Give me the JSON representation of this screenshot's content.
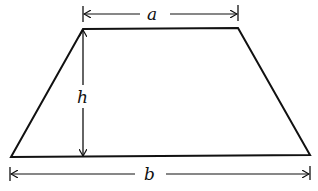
{
  "diagram": {
    "type": "trapezoid-dimensions",
    "labels": {
      "top_base": "a",
      "height": "h",
      "bottom_base": "b"
    },
    "colors": {
      "stroke": "#111111",
      "background": "#ffffff"
    }
  }
}
